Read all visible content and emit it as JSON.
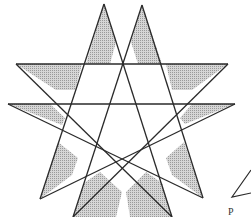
{
  "figure": {
    "stroke_color": "#2a2a2a",
    "shade_color": "#bdbdbd",
    "background": "#ffffff",
    "lines": [
      {
        "id": "upper-horizontal",
        "x1": 16,
        "y1": 64,
        "x2": 228,
        "y2": 64
      },
      {
        "id": "lower-horizontal",
        "x1": 8,
        "y1": 104,
        "x2": 235,
        "y2": 104
      },
      {
        "id": "left-apex-left-edge",
        "x1": 104,
        "y1": 4,
        "x2": 40,
        "y2": 199
      },
      {
        "id": "left-apex-right-edge",
        "x1": 104,
        "y1": 4,
        "x2": 172,
        "y2": 217
      },
      {
        "id": "right-apex-left-edge",
        "x1": 142,
        "y1": 5,
        "x2": 73,
        "y2": 217
      },
      {
        "id": "right-apex-right-edge",
        "x1": 142,
        "y1": 5,
        "x2": 203,
        "y2": 198
      },
      {
        "id": "upper-left-diagonal",
        "x1": 16,
        "y1": 64,
        "x2": 172,
        "y2": 217
      },
      {
        "id": "upper-right-diagonal",
        "x1": 228,
        "y1": 64,
        "x2": 73,
        "y2": 217
      },
      {
        "id": "lower-left-diagonal",
        "x1": 8,
        "y1": 104,
        "x2": 203,
        "y2": 198
      },
      {
        "id": "lower-right-diagonal",
        "x1": 235,
        "y1": 104,
        "x2": 40,
        "y2": 199
      }
    ],
    "shaded_regions": [
      {
        "id": "left-apex-shade",
        "points": "104,4 86,64 110,64 116,42"
      },
      {
        "id": "right-apex-shade",
        "points": "142,5 131,42 138,64 162,64"
      },
      {
        "id": "upper-left-arm-shade",
        "points": "16,64 82,64 75,90 56,90"
      },
      {
        "id": "upper-right-arm-shade",
        "points": "228,64 166,64 172,90 192,90"
      },
      {
        "id": "lower-left-arm-shade",
        "points": "8,104 50,104 65,118 62,125"
      },
      {
        "id": "lower-right-arm-shade",
        "points": "235,104 192,104 180,118 185,124"
      },
      {
        "id": "bottom-left-tip-shade",
        "points": "40,199 58,142 78,158 72,175"
      },
      {
        "id": "bottom-right-tip-shade",
        "points": "203,198 184,142 166,158 172,175"
      },
      {
        "id": "bottom-inner-left-shade",
        "points": "73,217 84,183 100,172 122,192 116,217"
      },
      {
        "id": "bottom-inner-right-shade",
        "points": "172,217 162,183 146,172 126,192 130,217"
      }
    ],
    "side_figure": {
      "id": "partial-triangle",
      "points": "251,170 232,197 251,193"
    },
    "caption_fragment": "P"
  }
}
